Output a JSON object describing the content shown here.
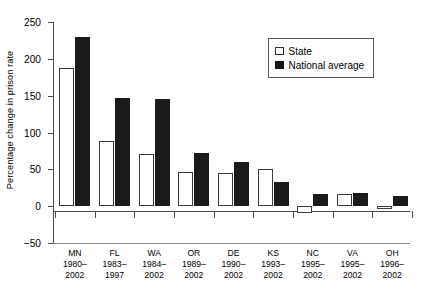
{
  "chart_data": {
    "type": "bar",
    "title": "",
    "xlabel": "",
    "ylabel": "Percentage change in prison rate",
    "ylim": [
      -50,
      250
    ],
    "yticks": [
      250,
      200,
      150,
      100,
      50,
      0,
      -50
    ],
    "ytick_labels": [
      "250",
      "200",
      "150",
      "100",
      "50",
      "0",
      "−50"
    ],
    "grid": false,
    "legend_position": "top-right",
    "categories": [
      "MN",
      "FL",
      "WA",
      "OR",
      "DE",
      "KS",
      "NC",
      "VA",
      "OH"
    ],
    "category_periods": [
      [
        "1980–",
        "2002"
      ],
      [
        "1983–",
        "1997"
      ],
      [
        "1984–",
        "2002"
      ],
      [
        "1989–",
        "2002"
      ],
      [
        "1990–",
        "2002"
      ],
      [
        "1993–",
        "2002"
      ],
      [
        "1995–",
        "2002"
      ],
      [
        "1995–",
        "2002"
      ],
      [
        "1996–",
        "2002"
      ]
    ],
    "series": [
      {
        "name": "State",
        "color": "#ffffff",
        "values": [
          188,
          88,
          71,
          47,
          45,
          51,
          -9,
          17,
          -4
        ]
      },
      {
        "name": "National average",
        "color": "#141414",
        "values": [
          229,
          147,
          145,
          72,
          60,
          33,
          17,
          18,
          14
        ]
      }
    ]
  },
  "legend": {
    "items": [
      {
        "label": "State",
        "swatch": "open-square-icon"
      },
      {
        "label": "National average",
        "swatch": "filled-square-icon"
      }
    ]
  }
}
